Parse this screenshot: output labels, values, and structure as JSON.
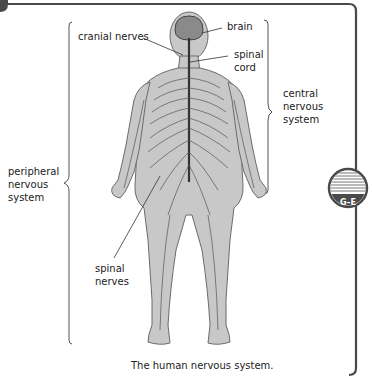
{
  "diagram": {
    "title": "The human nervous system.",
    "labels": {
      "cranial_nerves": "cranial nerves",
      "brain": "brain",
      "spinal_cord": [
        "spinal",
        "cord"
      ],
      "central_nervous_system": [
        "central",
        "nervous",
        "system"
      ],
      "peripheral_nervous_system": [
        "peripheral",
        "nervous",
        "system"
      ],
      "spinal_nerves": [
        "spinal",
        "nerves"
      ]
    },
    "badge": {
      "label": "G–E",
      "color": "#4a4a4a"
    },
    "colors": {
      "frame": "#4a4a4a",
      "body_fill": "#c8c8c8",
      "body_stroke": "#6b6b6b",
      "nerve": "#555555",
      "spinal_cord": "#333333",
      "brain_fill": "#8a8a8a"
    }
  }
}
